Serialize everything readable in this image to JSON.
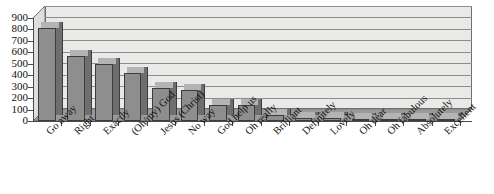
{
  "chart_data": {
    "type": "bar",
    "title": "",
    "subtitle": "",
    "xlabel": "",
    "ylabel": "",
    "ylim": [
      0,
      900
    ],
    "ytick_step": 100,
    "yticks": [
      900,
      800,
      700,
      600,
      500,
      400,
      300,
      200,
      100,
      0
    ],
    "grid": true,
    "legend": false,
    "three_d": true,
    "categories": [
      "Go away",
      "Right",
      "Exactly",
      "(Oh/my) God",
      "Jesus (Christ)",
      "No way",
      "God help us",
      "Oh really",
      "Brilliant",
      "Definitely",
      "Lovely",
      "Oh dear",
      "Oh fabulous",
      "Absolutely",
      "Excellent"
    ],
    "values": [
      815,
      570,
      500,
      420,
      285,
      270,
      140,
      140,
      55,
      30,
      25,
      12,
      10,
      10,
      10
    ],
    "series": [
      {
        "name": "Frequency",
        "values": [
          815,
          570,
          500,
          420,
          285,
          270,
          140,
          140,
          55,
          30,
          25,
          12,
          10,
          10,
          10
        ]
      }
    ]
  },
  "style": {
    "bar_face_color": "#8e8e8e",
    "bar_side_color": "#6e6e6e",
    "bar_top_color": "#b4b4b4",
    "bar_edge_color": "#3c3c3c",
    "plot_background_color": "#e9e9e7",
    "floor_color": "#9a9a9a",
    "gridline_color": "#8d8d8d",
    "axis_color": "#4a4a4a",
    "text_color": "#111111",
    "page_background_color": "#ffffff"
  },
  "page": {
    "bleed_text": ""
  }
}
